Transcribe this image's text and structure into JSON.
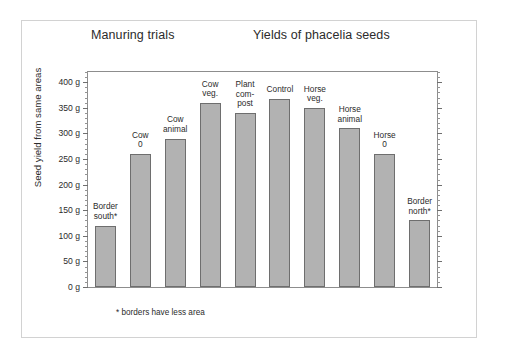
{
  "figure": {
    "title_left": "Manuring trials",
    "title_right": "Yields of phacelia seeds",
    "footnote": "* borders have less area",
    "bar_fill_color": "#b2b2b2",
    "bar_border_color": "#6e6e6e",
    "frame_color": "#8d8d8d",
    "outer_frame_color": "#d2d2d2",
    "background_color": "#ffffff"
  },
  "chart_data": {
    "type": "bar",
    "title": "Yields of phacelia seeds",
    "subtitle": "Manuring trials",
    "xlabel": "",
    "ylabel": "Seed yield from same areas",
    "ylim": [
      0,
      420
    ],
    "grid": false,
    "legend": "none",
    "y_tick_labels": [
      "0 g",
      "50 g",
      "100 g",
      "150 g",
      "200 g",
      "250 g",
      "300 g",
      "350 g",
      "400 g"
    ],
    "y_tick_values": [
      0,
      50,
      100,
      150,
      200,
      250,
      300,
      350,
      400
    ],
    "y_minor_tick_step": 10,
    "units": "g",
    "annotation": "* borders have less area",
    "categories": [
      "Border south*",
      "Cow 0",
      "Cow animal",
      "Cow veg.",
      "Plant com-post",
      "Control",
      "Horse veg.",
      "Horse animal",
      "Horse 0",
      "Border north*"
    ],
    "values": [
      120,
      260,
      290,
      360,
      340,
      368,
      350,
      310,
      260,
      130
    ],
    "bars": [
      {
        "label": "Border\nsouth*",
        "value": 120
      },
      {
        "label": "Cow\n0",
        "value": 260
      },
      {
        "label": "Cow\nanimal",
        "value": 290
      },
      {
        "label": "Cow\nveg.",
        "value": 360
      },
      {
        "label": "Plant\ncom-\npost",
        "value": 340
      },
      {
        "label": "Control",
        "value": 368
      },
      {
        "label": "Horse\nveg.",
        "value": 350
      },
      {
        "label": "Horse\nanimal",
        "value": 310
      },
      {
        "label": "Horse\n0",
        "value": 260
      },
      {
        "label": "Border\nnorth*",
        "value": 130
      }
    ]
  }
}
